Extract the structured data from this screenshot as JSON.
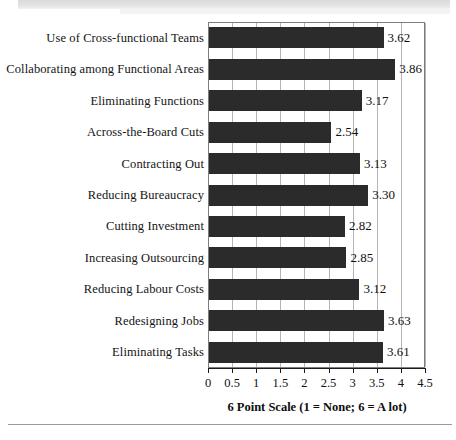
{
  "chart_data": {
    "type": "bar",
    "orientation": "horizontal",
    "title": "",
    "xlabel": "6 Point Scale (1 = None; 6 = A lot)",
    "ylabel": "",
    "xlim": [
      0,
      4.5
    ],
    "grid": true,
    "legend": null,
    "bar_color": "#2b2b2b",
    "categories": [
      "Use of Cross-functional Teams",
      "Collaborating among Functional Areas",
      "Eliminating Functions",
      "Across-the-Board Cuts",
      "Contracting Out",
      "Reducing Bureaucracy",
      "Cutting Investment",
      "Increasing Outsourcing",
      "Reducing Labour Costs",
      "Redesigning Jobs",
      "Eliminating Tasks"
    ],
    "values": [
      3.62,
      3.86,
      3.17,
      2.54,
      3.13,
      3.3,
      2.82,
      2.85,
      3.12,
      3.63,
      3.61
    ],
    "value_labels": [
      "3.62",
      "3.86",
      "3.17",
      "2.54",
      "3.13",
      "3.30",
      "2.82",
      "2.85",
      "3.12",
      "3.63",
      "3.61"
    ],
    "xticks": [
      0,
      0.5,
      1,
      1.5,
      2,
      2.5,
      3,
      3.5,
      4,
      4.5
    ],
    "xtick_labels": [
      "0",
      "0.5",
      "1",
      "1.5",
      "2",
      "2.5",
      "3",
      "3.5",
      "4",
      "4.5"
    ]
  }
}
